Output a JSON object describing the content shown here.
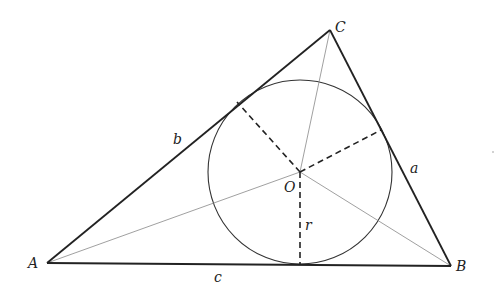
{
  "diagram": {
    "vertices": {
      "A": {
        "label": "A",
        "x": 47,
        "y": 263
      },
      "B": {
        "label": "B",
        "x": 451,
        "y": 266
      },
      "C": {
        "label": "C",
        "x": 330,
        "y": 30
      }
    },
    "incenter": {
      "label": "O",
      "x": 300,
      "y": 172
    },
    "inradius": {
      "label": "r",
      "value_px": 93
    },
    "sides": {
      "a": {
        "label": "a",
        "from": "B",
        "to": "C"
      },
      "b": {
        "label": "b",
        "from": "A",
        "to": "C"
      },
      "c": {
        "label": "c",
        "from": "A",
        "to": "B"
      }
    },
    "stroke_color": "#222222",
    "thin_line_color": "#777777"
  }
}
